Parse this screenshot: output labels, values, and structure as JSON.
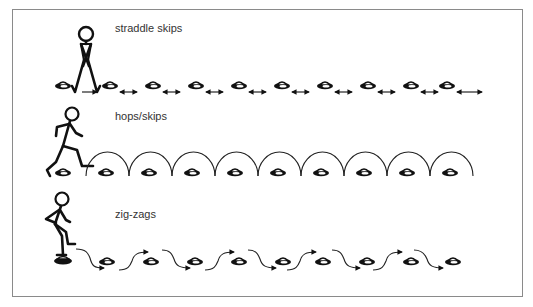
{
  "figure": {
    "colors": {
      "border": "#8a8a8a",
      "ink": "#111111",
      "text": "#333333"
    },
    "drills": [
      {
        "id": "straddle-skips",
        "label": "straddle skips",
        "label_pos": {
          "x": 115,
          "y": 22
        },
        "figure": "stick-figure-straddle",
        "cone_y": 86,
        "cones_x": [
          36,
          97,
          140,
          183,
          226,
          269,
          312,
          355,
          398,
          441
        ],
        "connector": "double-arrow"
      },
      {
        "id": "hops-skips",
        "label": "hops/skips",
        "label_pos": {
          "x": 115,
          "y": 110
        },
        "figure": "stick-figure-running",
        "cone_y": 172,
        "cones_x": [
          46,
          106,
          149,
          192,
          235,
          278,
          321,
          364,
          407,
          450
        ],
        "connector": "arc"
      },
      {
        "id": "zig-zags",
        "label": "zig-zags",
        "label_pos": {
          "x": 115,
          "y": 210
        },
        "figure": "stick-figure-stepping",
        "cone_y": 262,
        "cones_x": [
          40,
          106,
          150,
          194,
          238,
          282,
          326,
          370,
          414,
          454
        ],
        "connector": "s-curve-arrow"
      }
    ]
  }
}
